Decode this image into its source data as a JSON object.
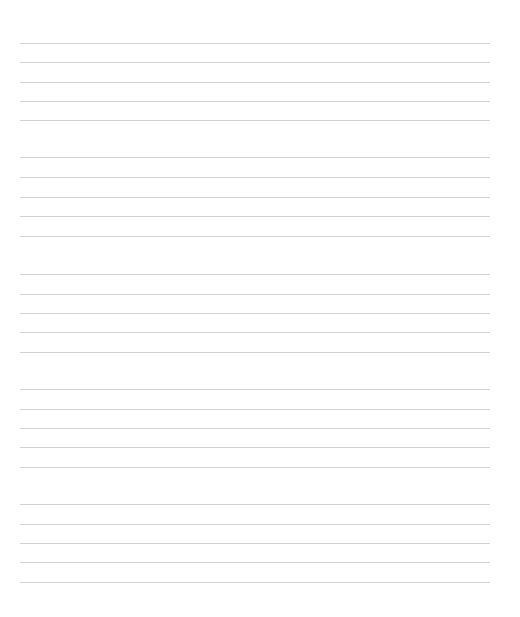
{
  "page": {
    "type": "lined-paper",
    "background_color": "#ffffff",
    "line_color": "#d2d2d2",
    "line_left": 20,
    "line_right": 490,
    "groups": [
      {
        "lines": [
          43,
          62,
          82,
          101,
          120
        ]
      },
      {
        "lines": [
          157,
          177,
          197,
          216,
          236
        ]
      },
      {
        "lines": [
          274,
          294,
          313,
          332,
          352
        ]
      },
      {
        "lines": [
          389,
          409,
          428,
          447,
          467
        ]
      },
      {
        "lines": [
          504,
          524,
          543,
          562,
          582
        ]
      }
    ]
  }
}
